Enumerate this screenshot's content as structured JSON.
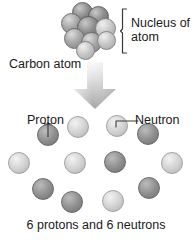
{
  "diagram": {
    "background": "#ffffff",
    "text_color": "#1a1a1a",
    "labels": {
      "nucleus_line1": "Nucleus of",
      "nucleus_line2": "atom",
      "carbon_atom": "Carbon atom",
      "proton": "Proton",
      "neutron": "Neutron",
      "caption": "6 protons and 6 neutrons"
    },
    "icons": {
      "bracket": "curly-bracket-icon",
      "arrow": "down-arrow-icon",
      "proton_leader": "leader-line-icon",
      "neutron_leader": "leader-line-icon"
    },
    "colors": {
      "proton_dark": "#8e8e8e",
      "proton_dark_edge": "#6b6b6b",
      "neutron_light": "#d2d2d2",
      "neutron_light_edge": "#a8a8a8",
      "arrow_fill_top": "#f2f2f2",
      "arrow_fill_bottom": "#9b9b9b",
      "outline": "#707070"
    },
    "counts": {
      "protons": 6,
      "neutrons": 6,
      "nucleus_cluster_spheres": 9
    }
  },
  "chart_data": {
    "type": "diagram",
    "nucleus_cluster": [
      {
        "id": "n1",
        "cx": 22,
        "cy": 10,
        "r": 10.5,
        "shade": "dark"
      },
      {
        "id": "n2",
        "cx": 38,
        "cy": 14,
        "r": 10.5,
        "shade": "dark"
      },
      {
        "id": "n3",
        "cx": 11,
        "cy": 21,
        "r": 10.5,
        "shade": "mid"
      },
      {
        "id": "n4",
        "cx": 28,
        "cy": 25,
        "r": 11.5,
        "shade": "dark"
      },
      {
        "id": "n5",
        "cx": 45,
        "cy": 26,
        "r": 10.5,
        "shade": "light"
      },
      {
        "id": "n6",
        "cx": 14,
        "cy": 36,
        "r": 10.5,
        "shade": "mid"
      },
      {
        "id": "n7",
        "cx": 31,
        "cy": 40,
        "r": 10.5,
        "shade": "mid"
      },
      {
        "id": "n8",
        "cx": 46,
        "cy": 38,
        "r": 9.5,
        "shade": "light"
      },
      {
        "id": "n9",
        "cx": 25,
        "cy": 48,
        "r": 9.5,
        "shade": "light"
      }
    ],
    "particles": [
      {
        "id": "p1",
        "cx": 48,
        "cy": 135,
        "r": 11,
        "type": "proton",
        "label": "Proton"
      },
      {
        "id": "p2",
        "cx": 78,
        "cy": 127,
        "r": 11,
        "type": "neutron"
      },
      {
        "id": "p3",
        "cx": 117,
        "cy": 126,
        "r": 11,
        "type": "neutron",
        "label": "Neutron"
      },
      {
        "id": "p4",
        "cx": 148,
        "cy": 134,
        "r": 11,
        "type": "proton"
      },
      {
        "id": "p5",
        "cx": 19,
        "cy": 163,
        "r": 11,
        "type": "neutron"
      },
      {
        "id": "p6",
        "cx": 75,
        "cy": 163,
        "r": 11,
        "type": "neutron"
      },
      {
        "id": "p7",
        "cx": 115,
        "cy": 162,
        "r": 11,
        "type": "proton"
      },
      {
        "id": "p8",
        "cx": 172,
        "cy": 163,
        "r": 11,
        "type": "neutron"
      },
      {
        "id": "p9",
        "cx": 43,
        "cy": 189,
        "r": 11,
        "type": "proton"
      },
      {
        "id": "p10",
        "cx": 149,
        "cy": 188,
        "r": 11,
        "type": "proton"
      },
      {
        "id": "p11",
        "cx": 72,
        "cy": 202,
        "r": 11,
        "type": "proton"
      },
      {
        "id": "p12",
        "cx": 113,
        "cy": 201,
        "r": 11,
        "type": "neutron"
      }
    ],
    "annotations": [
      {
        "text": "Nucleus of atom",
        "target": "nucleus_cluster",
        "position": "right"
      },
      {
        "text": "Carbon atom",
        "target": "whole_atom",
        "position": "left"
      },
      {
        "text": "Proton",
        "target": "p1",
        "position": "above-left"
      },
      {
        "text": "Neutron",
        "target": "p3",
        "position": "right"
      },
      {
        "text": "6 protons and 6 neutrons",
        "target": "particles",
        "position": "bottom"
      }
    ]
  }
}
